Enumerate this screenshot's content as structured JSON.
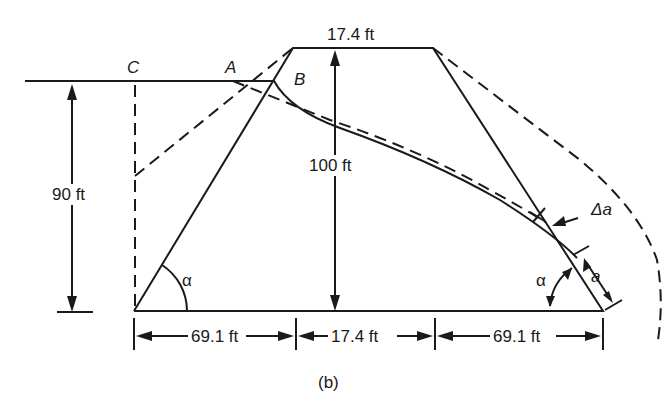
{
  "figure": {
    "caption": "(b)",
    "labels": {
      "crest_width": "17.4 ft",
      "dam_height": "100 ft",
      "water_depth": "90 ft",
      "base_left": "69.1 ft",
      "base_middle": "17.4 ft",
      "base_right": "69.1 ft",
      "point_a": "A",
      "point_b": "B",
      "point_c": "C",
      "angle_left": "α",
      "angle_right": "α",
      "delta_a": "Δa",
      "a": "a"
    },
    "colors": {
      "stroke": "#1a1a1a",
      "background": "#ffffff"
    }
  }
}
